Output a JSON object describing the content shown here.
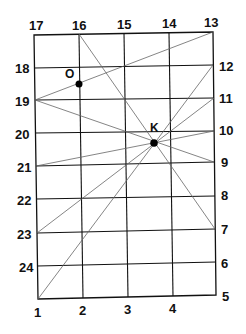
{
  "diagram": {
    "top_labels": [
      "17",
      "16",
      "15",
      "14",
      "13"
    ],
    "left_labels": [
      "18",
      "19",
      "20",
      "21",
      "22",
      "23",
      "24"
    ],
    "right_labels": [
      "12",
      "11",
      "10",
      "9",
      "8",
      "7",
      "6",
      "5"
    ],
    "bottom_labels": [
      "1",
      "2",
      "3",
      "4"
    ],
    "points": {
      "O": "O",
      "K": "K"
    },
    "lines": [
      {
        "from": "19",
        "to": "13",
        "through": "O"
      },
      {
        "from": "16",
        "to": "7",
        "through": "K"
      },
      {
        "from": "19",
        "to": "9",
        "through": "K"
      },
      {
        "from": "21",
        "to": "10",
        "through": "K"
      },
      {
        "from": "23",
        "to": "11",
        "through": "K"
      },
      {
        "from": "1",
        "to": "12",
        "through": "K"
      }
    ],
    "colors": {
      "grid": "#111111",
      "thin_lines": "#555555",
      "points": "#000000"
    }
  }
}
